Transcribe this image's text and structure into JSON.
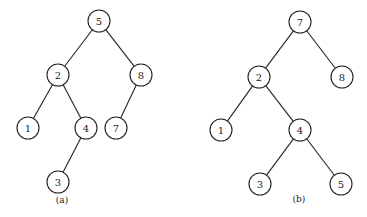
{
  "trees": [
    {
      "caption": "(a)",
      "caption_pos": [
        62,
        203
      ],
      "nodes": [
        {
          "id": "a5",
          "label": "5",
          "x": 99,
          "y": 21
        },
        {
          "id": "a2",
          "label": "2",
          "x": 58,
          "y": 75
        },
        {
          "id": "a8",
          "label": "8",
          "x": 141,
          "y": 75
        },
        {
          "id": "a1",
          "label": "1",
          "x": 28,
          "y": 128
        },
        {
          "id": "a4",
          "label": "4",
          "x": 86,
          "y": 128
        },
        {
          "id": "a7",
          "label": "7",
          "x": 116,
          "y": 128
        },
        {
          "id": "a3",
          "label": "3",
          "x": 58,
          "y": 182
        }
      ],
      "edges": [
        [
          "a5",
          "a2"
        ],
        [
          "a5",
          "a8"
        ],
        [
          "a2",
          "a1"
        ],
        [
          "a2",
          "a4"
        ],
        [
          "a8",
          "a7"
        ],
        [
          "a4",
          "a3"
        ]
      ]
    },
    {
      "caption": "(b)",
      "caption_pos": [
        299,
        202
      ],
      "nodes": [
        {
          "id": "b7",
          "label": "7",
          "x": 300,
          "y": 22
        },
        {
          "id": "b2",
          "label": "2",
          "x": 259,
          "y": 77
        },
        {
          "id": "b8",
          "label": "8",
          "x": 342,
          "y": 77
        },
        {
          "id": "b1",
          "label": "1",
          "x": 221,
          "y": 130
        },
        {
          "id": "b4",
          "label": "4",
          "x": 300,
          "y": 130
        },
        {
          "id": "b3",
          "label": "3",
          "x": 260,
          "y": 184
        },
        {
          "id": "b5",
          "label": "5",
          "x": 341,
          "y": 184
        }
      ],
      "edges": [
        [
          "b7",
          "b2"
        ],
        [
          "b7",
          "b8"
        ],
        [
          "b2",
          "b1"
        ],
        [
          "b2",
          "b4"
        ],
        [
          "b4",
          "b3"
        ],
        [
          "b4",
          "b5"
        ]
      ]
    }
  ],
  "node_radius": 11
}
